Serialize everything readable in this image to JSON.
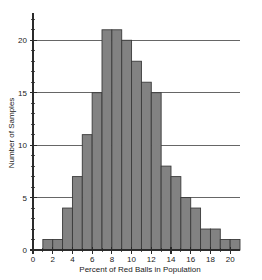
{
  "chart_data": {
    "type": "bar",
    "title": "",
    "subtitle": "",
    "xlabel": "Percent of Red Balls in Population",
    "ylabel": "Number of Samples",
    "xlim": [
      0,
      21
    ],
    "ylim": [
      0,
      22.6
    ],
    "grid": "horizontal-major-only",
    "legend": "none",
    "bin_width": 1,
    "bin_starts": [
      1,
      2,
      3,
      4,
      5,
      6,
      7,
      8,
      9,
      10,
      11,
      12,
      13,
      14,
      15,
      16,
      17,
      18,
      19,
      20
    ],
    "categories": [
      "1-2",
      "2-3",
      "3-4",
      "4-5",
      "5-6",
      "6-7",
      "7-8",
      "8-9",
      "9-10",
      "10-11",
      "11-12",
      "12-13",
      "13-14",
      "14-15",
      "15-16",
      "16-17",
      "17-18",
      "18-19",
      "19-20",
      "20-21"
    ],
    "values": [
      1,
      1,
      4,
      7,
      11,
      15,
      21,
      21,
      20,
      18,
      16,
      15,
      8,
      7,
      5,
      4,
      2,
      2,
      1,
      1
    ],
    "xticks": [
      0,
      2,
      4,
      6,
      8,
      10,
      12,
      14,
      16,
      18,
      20
    ],
    "xticklabels": [
      "0",
      "2",
      "4",
      "6",
      "8",
      "10",
      "12",
      "14",
      "16",
      "18",
      "20"
    ],
    "xminor_ticks": [
      1,
      3,
      5,
      7,
      9,
      11,
      13,
      15,
      17,
      19
    ],
    "yticks": [
      0,
      5,
      10,
      15,
      20
    ],
    "yticklabels": [
      "0",
      "5",
      "10",
      "15",
      "20"
    ],
    "yminor_ticks": [
      1,
      2,
      3,
      4,
      6,
      7,
      8,
      9,
      11,
      12,
      13,
      14,
      16,
      17,
      18,
      19,
      21,
      22
    ],
    "gridline_values": [
      5,
      10,
      15,
      20
    ],
    "colors": {
      "bar_fill": "#828282",
      "bar_edge": "#3a3a3a",
      "axis": "#2b2b2b",
      "grid": "#555555",
      "background": "#ffffff",
      "text": "#1a1a1a"
    }
  }
}
